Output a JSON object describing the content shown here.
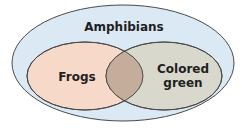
{
  "diagram": {
    "type": "venn",
    "outer": {
      "label": "Amphibians",
      "fill": "#dbe9f4",
      "stroke": "#4a4a4a"
    },
    "left": {
      "label": "Frogs",
      "fill": "#f6d9c8",
      "stroke": "#4a4a4a"
    },
    "right": {
      "label_line1": "Colored",
      "label_line2": "green",
      "fill": "#d9d8cc",
      "stroke": "#4a4a4a"
    },
    "intersection": {
      "fill": "#c4ad9a"
    }
  }
}
